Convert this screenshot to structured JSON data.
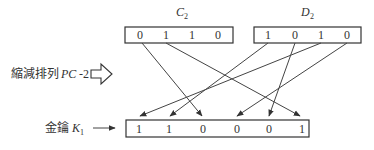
{
  "c2": {
    "label": "C",
    "subscript": "2",
    "bits": [
      "0",
      "1",
      "1",
      "0"
    ]
  },
  "d2": {
    "label": "D",
    "subscript": "2",
    "bits": [
      "1",
      "0",
      "1",
      "0"
    ]
  },
  "permutation": {
    "label_cjk": "縮減排列",
    "label_var": "PC",
    "label_suffix": "-2"
  },
  "k1": {
    "label_cjk": "金鑰",
    "label": "K",
    "subscript": "1",
    "bits": [
      "1",
      "1",
      "0",
      "0",
      "0",
      "1"
    ]
  },
  "mapping": [
    {
      "from": "D2[2]",
      "to": "K1[0]"
    },
    {
      "from": "D2[0]",
      "to": "K1[1]"
    },
    {
      "from": "C2[0]",
      "to": "K1[2]"
    },
    {
      "from": "D2[3]",
      "to": "K1[3]"
    },
    {
      "from": "D2[1]",
      "to": "K1[4]"
    },
    {
      "from": "C2[1]",
      "to": "K1[5]"
    }
  ]
}
